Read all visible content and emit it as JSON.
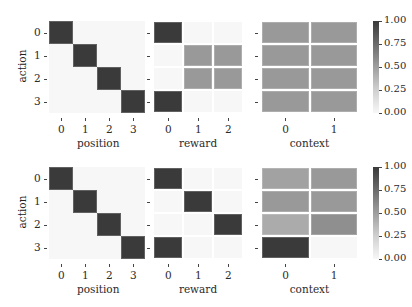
{
  "chart_data": [
    {
      "type": "heatmap",
      "row": "top",
      "ylabel": "action",
      "row_labels": [
        "0",
        "1",
        "2",
        "3"
      ],
      "colorbar": {
        "ticks": [
          "1.00",
          "0.75",
          "0.50",
          "0.25",
          "0.00"
        ],
        "range": [
          0,
          1
        ],
        "cmap": "Greys"
      },
      "panels": [
        {
          "xlabel": "position",
          "col_labels": [
            "0",
            "1",
            "2",
            "3"
          ],
          "values": [
            [
              1,
              0,
              0,
              0
            ],
            [
              0,
              1,
              0,
              0
            ],
            [
              0,
              0,
              1,
              0
            ],
            [
              0,
              0,
              0,
              1
            ]
          ]
        },
        {
          "xlabel": "reward",
          "col_labels": [
            "0",
            "1",
            "2"
          ],
          "values": [
            [
              1,
              0,
              0
            ],
            [
              0,
              0.5,
              0.5
            ],
            [
              0,
              0.5,
              0.5
            ],
            [
              1,
              0,
              0
            ]
          ]
        },
        {
          "xlabel": "context",
          "col_labels": [
            "0",
            "1"
          ],
          "values": [
            [
              0.5,
              0.5
            ],
            [
              0.5,
              0.5
            ],
            [
              0.5,
              0.5
            ],
            [
              0.5,
              0.5
            ]
          ]
        }
      ]
    },
    {
      "type": "heatmap",
      "row": "bottom",
      "ylabel": "action",
      "row_labels": [
        "0",
        "1",
        "2",
        "3"
      ],
      "colorbar": {
        "ticks": [
          "1.00",
          "0.75",
          "0.50",
          "0.25",
          "0.00"
        ],
        "range": [
          0,
          1
        ],
        "cmap": "Greys"
      },
      "panels": [
        {
          "xlabel": "position",
          "col_labels": [
            "0",
            "1",
            "2",
            "3"
          ],
          "values": [
            [
              1,
              0,
              0,
              0
            ],
            [
              0,
              1,
              0,
              0
            ],
            [
              0,
              0,
              1,
              0
            ],
            [
              0,
              0,
              0,
              1
            ]
          ]
        },
        {
          "xlabel": "reward",
          "col_labels": [
            "0",
            "1",
            "2"
          ],
          "values": [
            [
              1,
              0,
              0
            ],
            [
              0,
              1,
              0
            ],
            [
              0,
              0,
              1
            ],
            [
              1,
              0,
              0
            ]
          ]
        },
        {
          "xlabel": "context",
          "col_labels": [
            "0",
            "1"
          ],
          "values": [
            [
              0.45,
              0.5
            ],
            [
              0.5,
              0.5
            ],
            [
              0.4,
              0.55
            ],
            [
              1,
              0
            ]
          ]
        }
      ]
    }
  ],
  "labels": {
    "ylabel": "action",
    "xlabels": [
      "position",
      "reward",
      "context"
    ],
    "rows": [
      "0",
      "1",
      "2",
      "3"
    ],
    "pos_cols": [
      "0",
      "1",
      "2",
      "3"
    ],
    "rew_cols": [
      "0",
      "1",
      "2"
    ],
    "ctx_cols": [
      "0",
      "1"
    ],
    "cbar_ticks": [
      "1.00",
      "0.75",
      "0.50",
      "0.25",
      "0.00"
    ]
  }
}
